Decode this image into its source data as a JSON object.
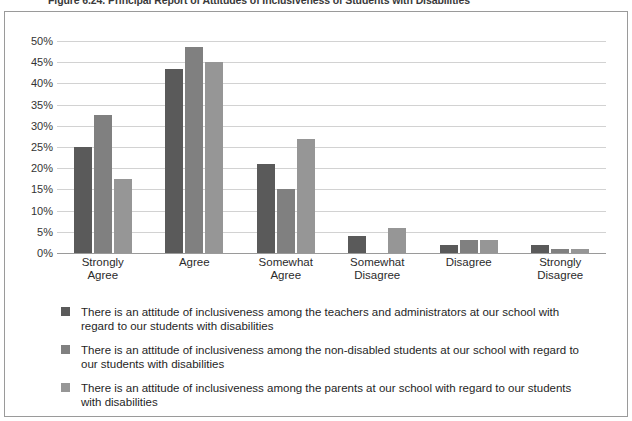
{
  "figure": {
    "caption": "Figure 6.24. Principal Report of Attitudes of Inclusiveness of Students with Disabilities"
  },
  "chart_data": {
    "type": "bar",
    "title": "Figure 6.24. Principal Report of Attitudes of Inclusiveness of Students with Disabilities",
    "xlabel": "",
    "ylabel": "",
    "ylim": [
      0,
      50
    ],
    "ytick_labels": [
      "0%",
      "5%",
      "10%",
      "15%",
      "20%",
      "25%",
      "30%",
      "35%",
      "40%",
      "45%",
      "50%"
    ],
    "ytick_values": [
      0,
      5,
      10,
      15,
      20,
      25,
      30,
      35,
      40,
      45,
      50
    ],
    "grid": true,
    "legend_position": "bottom",
    "categories": [
      "Strongly Agree",
      "Agree",
      "Somewhat Agree",
      "Somewhat Disagree",
      "Disagree",
      "Strongly Disagree"
    ],
    "category_lines": [
      [
        "Strongly",
        "Agree"
      ],
      [
        "Agree",
        ""
      ],
      [
        "Somewhat",
        "Agree"
      ],
      [
        "Somewhat",
        "Disagree"
      ],
      [
        "Disagree",
        ""
      ],
      [
        "Strongly",
        "Disagree"
      ]
    ],
    "series": [
      {
        "name": "There is an attitude of inclusiveness among the teachers and administrators at our school with regard to our students with disabilities",
        "color": "#5a5a5a",
        "values": [
          25,
          43.5,
          21,
          4,
          2,
          2
        ]
      },
      {
        "name": "There is an attitude of inclusiveness among the non-disabled students at our school with regard to our students with disabilities",
        "color": "#808080",
        "values": [
          32.5,
          48.5,
          15,
          0,
          3,
          1
        ]
      },
      {
        "name": "There is an attitude of inclusiveness among the parents at our school with regard to our students with disabilities",
        "color": "#969696",
        "values": [
          17.5,
          45,
          27,
          6,
          3,
          1
        ]
      }
    ]
  },
  "colors": {
    "series_1": "#5a5a5a",
    "series_2": "#808080",
    "series_3": "#969696",
    "gridline": "#d2d2d2",
    "axis": "#9a9a9a",
    "panel_border": "#9a9a9a",
    "background": "#ffffff"
  }
}
